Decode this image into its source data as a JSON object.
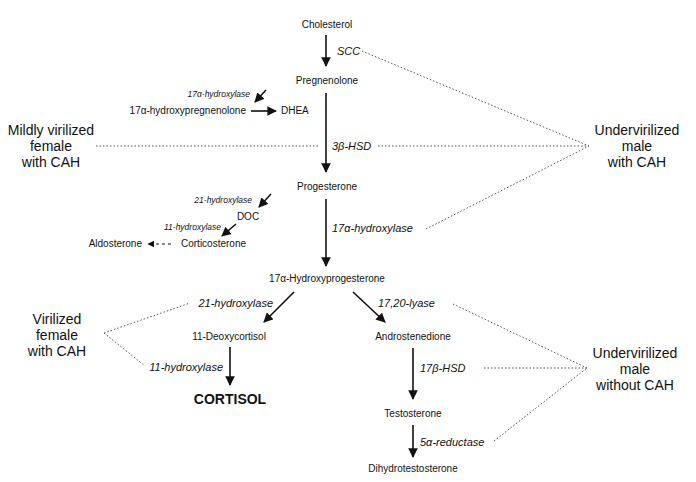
{
  "diagram": {
    "nodes": {
      "cholesterol": "Cholesterol",
      "pregnenolone": "Pregnenolone",
      "hydroxypregnenolone": "17α-hydroxypregnenolone",
      "dhea": "DHEA",
      "progesterone": "Progesterone",
      "doc": "DOC",
      "corticosterone": "Corticosterone",
      "aldosterone": "Aldosterone",
      "hydroxyprogesterone": "17α-Hydroxyprogesterone",
      "deoxycortisol": "11-Deoxycortisol",
      "cortisol": "CORTISOL",
      "androstenedione": "Androstenedione",
      "testosterone": "Testosterone",
      "dht": "Dihydrotestosterone"
    },
    "enzymes": {
      "scc": "SCC",
      "hydroxylase17_small": "17α-hydroxylase",
      "hsd3b": "3β-HSD",
      "hydroxylase21_small": "21-hydroxylase",
      "hydroxylase11_small": "11-hydroxylase",
      "hydroxylase17": "17α-hydroxylase",
      "hydroxylase21": "21-hydroxylase",
      "lyase1720": "17,20-lyase",
      "hydroxylase11": "11-hydroxylase",
      "hsd17b": "17β-HSD",
      "reductase5a": "5α-reductase"
    },
    "phenotypes": {
      "mildly_virilized_female": [
        "Mildly virilized",
        "female",
        "with CAH"
      ],
      "undervirilized_male_cah": [
        "Undervirilized",
        "male",
        "with CAH"
      ],
      "virilized_female": [
        "Virilized",
        "female",
        "with CAH"
      ],
      "undervirilized_male_no_cah": [
        "Undervirilized",
        "male",
        "without CAH"
      ]
    }
  }
}
